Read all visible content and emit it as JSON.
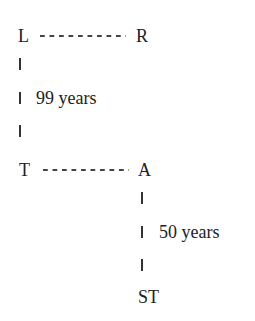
{
  "diagram": {
    "nodes": {
      "L": "L",
      "R": "R",
      "T": "T",
      "A": "A",
      "ST": "ST"
    },
    "edges": [
      {
        "from": "L",
        "to": "R",
        "style": "dashed"
      },
      {
        "from": "L",
        "to": "T",
        "style": "solid-vertical",
        "label": "99 years"
      },
      {
        "from": "T",
        "to": "A",
        "style": "dashed"
      },
      {
        "from": "A",
        "to": "ST",
        "style": "solid-vertical",
        "label": "50 years"
      }
    ],
    "labels": {
      "lt_duration": "99 years",
      "ast_duration": "50 years"
    }
  }
}
